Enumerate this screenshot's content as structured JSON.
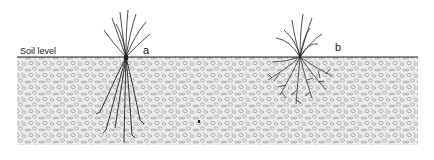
{
  "diagram": {
    "soil_label": "Soil level",
    "plants": [
      {
        "id": "a",
        "label": "a",
        "description": "plant with few long, thick roots"
      },
      {
        "id": "b",
        "label": "b",
        "description": "plant with dense, highly branched fibrous roots"
      }
    ],
    "colors": {
      "ink": "#222222",
      "soil_fill": "#e6e6e6",
      "pebble": "#8a8a8a",
      "background": "#ffffff"
    }
  }
}
